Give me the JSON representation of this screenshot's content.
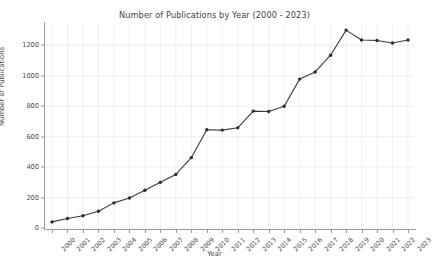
{
  "chart_data": {
    "type": "line",
    "title": "Number of Publications by Year (2000 - 2023)",
    "xlabel": "Year",
    "ylabel": "Number of Publications",
    "categories": [
      "2000",
      "2001",
      "2002",
      "2003",
      "2004",
      "2005",
      "2006",
      "2007",
      "2008",
      "2009",
      "2010",
      "2011",
      "2012",
      "2013",
      "2014",
      "2015",
      "2016",
      "2017",
      "2018",
      "2019",
      "2020",
      "2021",
      "2022",
      "2023"
    ],
    "values": [
      40,
      62,
      80,
      110,
      165,
      197,
      248,
      300,
      352,
      462,
      645,
      643,
      658,
      768,
      765,
      800,
      978,
      1025,
      1135,
      1300,
      1235,
      1232,
      1215,
      1235
    ],
    "series": [
      {
        "name": "Number of Publications",
        "values": [
          40,
          62,
          80,
          110,
          165,
          197,
          248,
          300,
          352,
          462,
          645,
          643,
          658,
          768,
          765,
          800,
          978,
          1025,
          1135,
          1300,
          1235,
          1232,
          1215,
          1235
        ]
      }
    ],
    "ylim": [
      0,
      1340
    ],
    "yticks": [
      0,
      200,
      400,
      600,
      800,
      1000,
      1200
    ],
    "ytick_labels": [
      "0",
      "200",
      "400",
      "600",
      "800",
      "1000",
      "1200"
    ],
    "grid": true,
    "grid_color": "#e8e8e8",
    "legend": false,
    "legend_position": "none",
    "line_color": "#3c3c3c",
    "marker": "circle",
    "marker_color": "#2b2b2b",
    "background_color": "#ffffff",
    "xtick_rotation": -45
  }
}
